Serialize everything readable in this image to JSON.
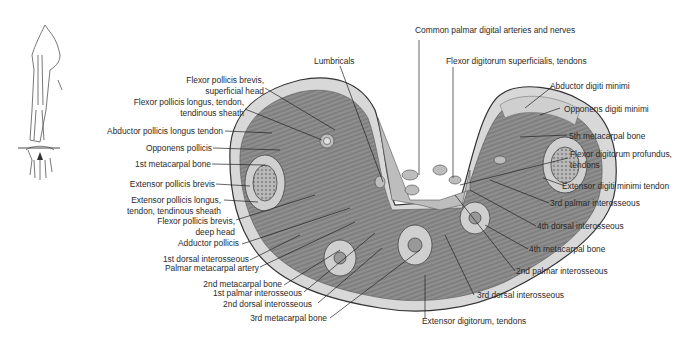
{
  "figure": {
    "orientation_inset": {
      "description": "arm skeleton outline with section line across the metacarpals"
    }
  },
  "labels": {
    "left": [
      {
        "id": "fpb-sup",
        "lines": [
          "Flexor pollicis brevis,",
          "superficial head"
        ]
      },
      {
        "id": "fpl",
        "lines": [
          "Flexor pollicis longus, tendon,",
          "tendinous sheath"
        ]
      },
      {
        "id": "apl",
        "lines": [
          "Abductor pollicis longus tendon"
        ]
      },
      {
        "id": "op",
        "lines": [
          "Opponens pollicis"
        ]
      },
      {
        "id": "mc1",
        "lines": [
          "1st metacarpal bone"
        ]
      },
      {
        "id": "epb",
        "lines": [
          "Extensor pollicis brevis"
        ]
      },
      {
        "id": "epl",
        "lines": [
          "Extensor pollicis longus,",
          "tendon, tendinous sheath"
        ]
      },
      {
        "id": "fpb-deep",
        "lines": [
          "Flexor pollicis brevis,",
          "deep head"
        ]
      },
      {
        "id": "ap",
        "lines": [
          "Adductor pollicis"
        ]
      },
      {
        "id": "di1",
        "lines": [
          "1st dorsal interosseous"
        ]
      },
      {
        "id": "pma",
        "lines": [
          "Palmar metacarpal artery"
        ]
      },
      {
        "id": "mc2",
        "lines": [
          "2nd metacarpal bone"
        ]
      },
      {
        "id": "pi1",
        "lines": [
          "1st palmar interosseous"
        ]
      },
      {
        "id": "di2",
        "lines": [
          "2nd dorsal interosseous"
        ]
      },
      {
        "id": "mc3",
        "lines": [
          "3rd metacarpal bone"
        ]
      }
    ],
    "top": [
      {
        "id": "lumb",
        "lines": [
          "Lumbricals"
        ]
      },
      {
        "id": "cpda",
        "lines": [
          "Common palmar digital arteries and nerves"
        ]
      },
      {
        "id": "fds",
        "lines": [
          "Flexor digitorum superficialis, tendons"
        ]
      }
    ],
    "right": [
      {
        "id": "adm",
        "lines": [
          "Abductor digiti minimi"
        ]
      },
      {
        "id": "odm",
        "lines": [
          "Opponens digiti minimi"
        ]
      },
      {
        "id": "mc5",
        "lines": [
          "5th metacarpal bone"
        ]
      },
      {
        "id": "fdp",
        "lines": [
          "Flexor digitorum profundus,",
          "tendons"
        ]
      },
      {
        "id": "edm",
        "lines": [
          "Extensor digiti minimi tendon"
        ]
      },
      {
        "id": "pi3",
        "lines": [
          "3rd palmar interosseous"
        ]
      },
      {
        "id": "di4",
        "lines": [
          "4th dorsal interosseous"
        ]
      },
      {
        "id": "mc4",
        "lines": [
          "4th metacarpal bone"
        ]
      },
      {
        "id": "pi2",
        "lines": [
          "2nd palmar interosseous"
        ]
      },
      {
        "id": "di3",
        "lines": [
          "3rd dorsal interosseous"
        ]
      },
      {
        "id": "ed",
        "lines": [
          "Extensor digitorum, tendons"
        ]
      }
    ]
  }
}
